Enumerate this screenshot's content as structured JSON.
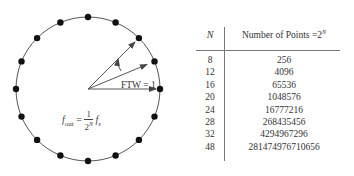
{
  "diagram": {
    "circle": {
      "cx": 88,
      "cy": 89,
      "r": 72,
      "num_points": 16
    },
    "arrows": [
      {
        "angle_deg": 0
      },
      {
        "angle_deg": 22.5
      },
      {
        "angle_deg": 45
      }
    ],
    "ftw_label": "FTW = 1",
    "formula": {
      "lhs": "f",
      "lhs_sub": "out",
      "equals": "=",
      "numerator": "1",
      "denominator": "2",
      "denominator_exp": "N",
      "rhs": "f",
      "rhs_sub": "s"
    }
  },
  "table": {
    "headers": {
      "n": "N",
      "points": "Number of Points =2",
      "points_exp": "N"
    },
    "rows": [
      {
        "n": "8",
        "points": "256"
      },
      {
        "n": "12",
        "points": "4096"
      },
      {
        "n": "16",
        "points": "65536"
      },
      {
        "n": "20",
        "points": "1048576"
      },
      {
        "n": "24",
        "points": "16777216"
      },
      {
        "n": "28",
        "points": "268435456"
      },
      {
        "n": "32",
        "points": "4294967296"
      },
      {
        "n": "48",
        "points": "281474976710656"
      }
    ]
  }
}
